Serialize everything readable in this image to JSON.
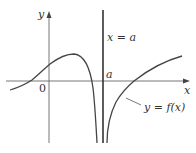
{
  "figure": {
    "axis_labels": {
      "y": "y",
      "x": "x",
      "origin": "0"
    },
    "asymptote_label": "x = a",
    "a_tick_label": "a",
    "curve_label": "y = f(x)",
    "colors": {
      "axis": "#555555",
      "curve": "#444444",
      "asymptote": "#333333",
      "text": "#333333"
    }
  }
}
